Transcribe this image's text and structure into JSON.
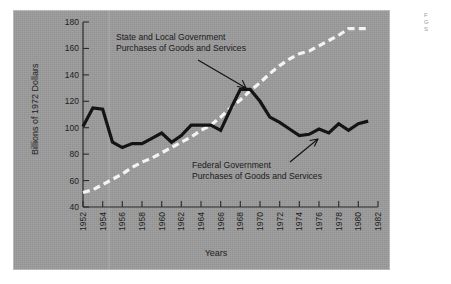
{
  "chart_data": {
    "type": "line",
    "title": "",
    "xlabel": "Years",
    "ylabel": "Billions of 1972 Dollars",
    "xlim": [
      1952,
      1982
    ],
    "ylim": [
      40,
      180
    ],
    "xticks": [
      1952,
      1954,
      1956,
      1958,
      1960,
      1962,
      1964,
      1966,
      1968,
      1970,
      1972,
      1974,
      1976,
      1978,
      1980,
      1982
    ],
    "yticks": [
      40,
      60,
      80,
      100,
      120,
      140,
      160,
      180
    ],
    "grid": false,
    "legend_position": "inline-annotations",
    "x": [
      1952,
      1953,
      1954,
      1955,
      1956,
      1957,
      1958,
      1959,
      1960,
      1961,
      1962,
      1963,
      1964,
      1965,
      1966,
      1967,
      1968,
      1969,
      1970,
      1971,
      1972,
      1973,
      1974,
      1975,
      1976,
      1977,
      1978,
      1979,
      1980,
      1981
    ],
    "series": [
      {
        "name": "Federal Government Purchases of Goods and Services",
        "color": "#141414",
        "style": "solid",
        "values": [
          101,
          115,
          114,
          89,
          85,
          88,
          88,
          92,
          96,
          89,
          94,
          102,
          102,
          102,
          98,
          114,
          129,
          129,
          120,
          108,
          104,
          99,
          94,
          95,
          99,
          96,
          103,
          98,
          103,
          105
        ]
      },
      {
        "name": "State and Local Government Purchases of Goods and Services",
        "color": "#f4f4f4",
        "style": "dashed",
        "values": [
          51,
          53,
          57,
          61,
          65,
          70,
          74,
          77,
          81,
          85,
          89,
          93,
          98,
          102,
          108,
          115,
          121,
          128,
          134,
          141,
          147,
          152,
          156,
          158,
          162,
          166,
          170,
          175,
          175,
          175
        ]
      }
    ],
    "annotations": [
      {
        "id": "state-local",
        "line1": "State and Local Government",
        "line2": "Purchases of Goods and Services",
        "points_to": "state-local-series"
      },
      {
        "id": "federal",
        "line1": "Federal Government",
        "line2": "Purchases of Goods and Services",
        "points_to": "federal-series"
      }
    ]
  },
  "side_caption": {
    "line1": "F",
    "line2": "G",
    "line3": "S"
  }
}
